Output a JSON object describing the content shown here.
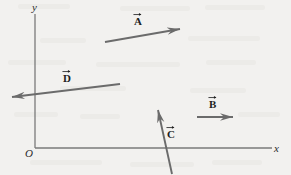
{
  "figure": {
    "type": "vector-diagram",
    "background_color": "#f2f1ef",
    "stroke_color": "#6b6b6b",
    "label_color": "#1e1e1e",
    "axes": {
      "origin_label": "O",
      "x_label": "x",
      "y_label": "y",
      "x_axis": {
        "x1": 35,
        "y1": 148,
        "x2": 272,
        "y2": 148
      },
      "y_axis": {
        "x1": 35,
        "y1": 148,
        "x2": 35,
        "y2": 14
      }
    },
    "vectors": [
      {
        "name": "A",
        "label": "A",
        "tail": {
          "x": 105,
          "y": 42
        },
        "head": {
          "x": 180,
          "y": 29
        },
        "direction": "up-right",
        "label_pos": {
          "x": 134,
          "y": 16
        }
      },
      {
        "name": "B",
        "label": "B",
        "tail": {
          "x": 197,
          "y": 117
        },
        "head": {
          "x": 233,
          "y": 117
        },
        "direction": "right",
        "label_pos": {
          "x": 209,
          "y": 99
        }
      },
      {
        "name": "C",
        "label": "C",
        "tail": {
          "x": 172,
          "y": 174
        },
        "head": {
          "x": 158,
          "y": 110
        },
        "direction": "up-left",
        "label_pos": {
          "x": 167,
          "y": 129
        }
      },
      {
        "name": "D",
        "label": "D",
        "tail": {
          "x": 120,
          "y": 84
        },
        "head": {
          "x": 12,
          "y": 97
        },
        "direction": "left-down",
        "label_pos": {
          "x": 63,
          "y": 73
        }
      }
    ]
  }
}
